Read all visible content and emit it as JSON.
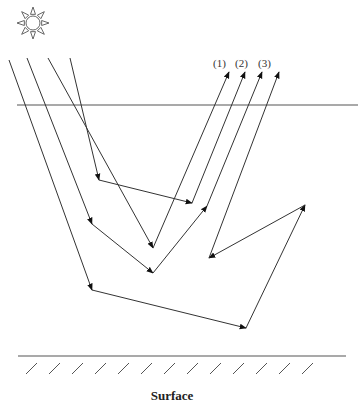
{
  "diagram": {
    "type": "light-ray-scattering-in-layer",
    "sun_icon": "sun-icon",
    "path_labels": [
      "(1)",
      "(2)",
      "(3)"
    ],
    "bottom_label": "Surface",
    "colors": {
      "line": "#333333",
      "boundary": "#555555",
      "background": "#ffffff"
    }
  }
}
